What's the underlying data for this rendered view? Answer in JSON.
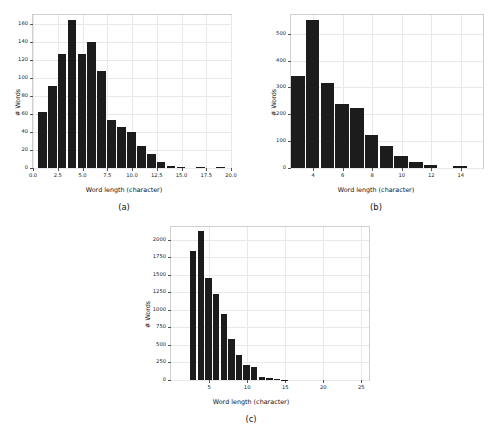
{
  "figure": {
    "background_color": "#ffffff",
    "bar_color": "#1c1c1c",
    "axis_frame_color": "#cfcfcf",
    "grid_color": "#e9e9e9"
  },
  "panels": [
    {
      "key": "a",
      "caption": "(a)",
      "chart_data": {
        "type": "bar",
        "title": "",
        "xlabel": "Word length (character)",
        "ylabel": "# Words",
        "xlim": [
          0,
          20
        ],
        "ylim": [
          0,
          170
        ],
        "xticks": [
          "0.0",
          "2.5",
          "5.0",
          "7.5",
          "10.0",
          "12.5",
          "15.0",
          "17.5",
          "20.0"
        ],
        "xtick_values": [
          0.0,
          2.5,
          5.0,
          7.5,
          10.0,
          12.5,
          15.0,
          17.5,
          20.0
        ],
        "yticks": [
          "0",
          "20",
          "40",
          "60",
          "80",
          "100",
          "120",
          "140",
          "160"
        ],
        "ytick_values": [
          0,
          20,
          40,
          60,
          80,
          100,
          120,
          140,
          160
        ],
        "grid": true,
        "legend": "none",
        "bin_width": 1,
        "categories": [
          1,
          2,
          3,
          4,
          5,
          6,
          7,
          8,
          9,
          10,
          11,
          12,
          13,
          14,
          15,
          16,
          17,
          18,
          19
        ],
        "values": [
          62,
          91,
          127,
          165,
          127,
          140,
          108,
          53,
          46,
          40,
          25,
          16,
          7,
          2,
          1,
          0,
          1,
          0,
          1
        ]
      }
    },
    {
      "key": "b",
      "caption": "(b)",
      "chart_data": {
        "type": "bar",
        "title": "",
        "xlabel": "Word length (character)",
        "ylabel": "# Words",
        "xlim": [
          2.5,
          15.5
        ],
        "ylim": [
          0,
          570
        ],
        "xticks": [
          "4",
          "6",
          "8",
          "10",
          "12",
          "14"
        ],
        "xtick_values": [
          4,
          6,
          8,
          10,
          12,
          14
        ],
        "yticks": [
          "0",
          "100",
          "200",
          "300",
          "400",
          "500"
        ],
        "ytick_values": [
          0,
          100,
          200,
          300,
          400,
          500
        ],
        "grid": true,
        "legend": "none",
        "bin_width": 1,
        "categories": [
          3,
          4,
          5,
          6,
          7,
          8,
          9,
          10,
          11,
          12,
          13,
          14
        ],
        "values": [
          342,
          551,
          315,
          238,
          222,
          122,
          83,
          43,
          24,
          10,
          0,
          9
        ]
      }
    },
    {
      "key": "c",
      "caption": "(c)",
      "chart_data": {
        "type": "bar",
        "title": "",
        "xlabel": "Word length (character)",
        "ylabel": "# Words",
        "xlim": [
          0,
          26
        ],
        "ylim": [
          0,
          2180
        ],
        "xticks": [
          "5",
          "10",
          "15",
          "20",
          "25"
        ],
        "xtick_values": [
          5,
          10,
          15,
          20,
          25
        ],
        "yticks": [
          "0",
          "250",
          "500",
          "750",
          "1000",
          "1250",
          "1500",
          "1750",
          "2000"
        ],
        "ytick_values": [
          0,
          250,
          500,
          750,
          1000,
          1250,
          1500,
          1750,
          2000
        ],
        "grid": true,
        "legend": "none",
        "bin_width": 1,
        "categories": [
          3,
          4,
          5,
          6,
          7,
          8,
          9,
          10,
          11,
          12,
          13,
          14,
          15
        ],
        "values": [
          1845,
          2120,
          1460,
          1225,
          940,
          585,
          350,
          215,
          180,
          45,
          30,
          8,
          5
        ]
      }
    }
  ]
}
